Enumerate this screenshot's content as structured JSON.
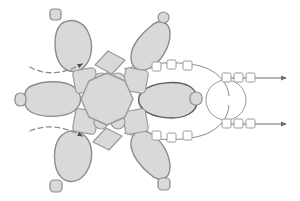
{
  "canvas": {
    "width": 300,
    "height": 201,
    "background": "#ffffff"
  },
  "palette": {
    "blob_fill": "#d9d9d9",
    "blob_stroke": "#8c8c8c",
    "blob_stroke_dark": "#595959",
    "node_fill": "#d9d9d9",
    "node_stroke": "#9a9a9a",
    "bead_fill": "#ffffff",
    "bead_stroke": "#9a9a9a",
    "track_stroke": "#8c8c8c",
    "arrow_stroke": "#6e6e6e",
    "dashed_stroke": "#8c8c8c",
    "ring_stroke": "#9a9a9a"
  },
  "diagram": {
    "type": "radial-schematic",
    "title": "",
    "center": {
      "name": "core",
      "shape": "polygon-circle",
      "cx": 107,
      "cy": 99,
      "r": 26
    },
    "lobes": [
      {
        "id": "lobe-upper-left",
        "label": "",
        "angle_deg": 125,
        "cap": true
      },
      {
        "id": "lobe-upper-right",
        "label": "",
        "angle_deg": 60,
        "cap": true
      },
      {
        "id": "lobe-left",
        "label": "",
        "angle_deg": 180,
        "cap": true
      },
      {
        "id": "lobe-right",
        "label": "",
        "angle_deg": 0,
        "cap": true,
        "emphasis": true
      },
      {
        "id": "lobe-lower-left",
        "label": "",
        "angle_deg": 235,
        "cap": true
      },
      {
        "id": "lobe-lower-right",
        "label": "",
        "angle_deg": 300,
        "cap": true
      }
    ],
    "inner_nodes": {
      "diamonds": 6,
      "small_circles": 4,
      "squares": 4
    },
    "dashed_arrows": [
      {
        "id": "dashed-arrow-top",
        "from_x": 30,
        "from_y": 70,
        "to_x": 82,
        "to_y": 65
      },
      {
        "id": "dashed-arrow-bottom",
        "from_x": 30,
        "from_y": 132,
        "to_x": 82,
        "to_y": 135
      }
    ],
    "tracks": [
      {
        "id": "track-upper",
        "beads": 3,
        "direction": "right"
      },
      {
        "id": "track-lower",
        "beads": 3,
        "direction": "right"
      }
    ],
    "junction_ring": {
      "id": "junction-ring",
      "cx": 226,
      "cy": 100,
      "r": 20
    },
    "output_arrows": [
      {
        "id": "output-arrow-upper",
        "beads": 3,
        "y": 78,
        "x_start": 222,
        "x_end": 290
      },
      {
        "id": "output-arrow-lower",
        "beads": 3,
        "y": 124,
        "x_start": 222,
        "x_end": 290
      }
    ]
  }
}
